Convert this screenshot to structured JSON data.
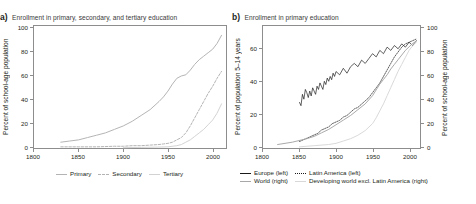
{
  "figure": {
    "panels": [
      {
        "letter": "a)",
        "title": "Enrollment in primary, secondary, and tertiary education",
        "y_left_title": "Percent of school-age population",
        "y_left_ticks": [
          "0",
          "20",
          "40",
          "60",
          "80",
          "100"
        ],
        "x_ticks": [
          "1800",
          "1850",
          "1900",
          "1950",
          "2000"
        ],
        "legend": [
          {
            "label": "Primary",
            "style": "solid-gray"
          },
          {
            "label": "Secondary",
            "style": "dash-gray"
          },
          {
            "label": "Tertiary",
            "style": "solid-light"
          }
        ]
      },
      {
        "letter": "b)",
        "title": "Enrollment in primary education",
        "y_left_title": "Percent of population 5–14 years",
        "y_left_ticks": [
          "0",
          "20",
          "40",
          "60"
        ],
        "y_right_title": "Percent of school-age population",
        "y_right_ticks": [
          "0",
          "20",
          "40",
          "60",
          "80",
          "100"
        ],
        "x_ticks": [
          "1800",
          "1850",
          "1900",
          "1950",
          "2000"
        ],
        "legend": [
          {
            "label": "Europe (left)",
            "style": "solid-black"
          },
          {
            "label": "Latin America (left)",
            "style": "dot-black"
          },
          {
            "label": "World (right)",
            "style": "solid-mgray"
          },
          {
            "label": "Developing world excl. Latin America (right)",
            "style": "solid-lgray"
          }
        ]
      }
    ]
  },
  "colors": {
    "primary": "#b3b3b3",
    "secondary": "#b3b3b3",
    "tertiary": "#d2d2d2",
    "europe": "#1a1a1a",
    "latin_america": "#1a1a1a",
    "world": "#a8a8a8",
    "developing_world": "#d8d8d8",
    "axis": "#8d8d8d",
    "text": "#231f20"
  },
  "chart_data": [
    {
      "type": "line",
      "panel": "a",
      "title": "Enrollment in primary, secondary, and tertiary education",
      "xlabel": "",
      "ylabel": "Percent of school-age population",
      "xlim": [
        1800,
        2015
      ],
      "ylim": [
        0,
        105
      ],
      "yticks": [
        0,
        20,
        40,
        60,
        80,
        100
      ],
      "xticks": [
        1800,
        1850,
        1900,
        1950,
        2000
      ],
      "grid": false,
      "legend_position": "below",
      "series": [
        {
          "name": "Primary",
          "style": "solid",
          "color": "#b3b3b3",
          "x": [
            1830,
            1840,
            1850,
            1860,
            1870,
            1880,
            1890,
            1900,
            1910,
            1920,
            1930,
            1940,
            1945,
            1950,
            1955,
            1960,
            1965,
            1970,
            1975,
            1980,
            1985,
            1990,
            1995,
            2000,
            2005,
            2010
          ],
          "y": [
            5,
            6,
            7,
            9,
            11,
            13,
            16,
            19,
            23,
            28,
            33,
            40,
            44,
            49,
            55,
            60,
            62,
            63,
            67,
            72,
            76,
            79,
            82,
            85,
            90,
            97
          ]
        },
        {
          "name": "Secondary",
          "style": "dashed",
          "color": "#b3b3b3",
          "x": [
            1830,
            1850,
            1870,
            1890,
            1900,
            1910,
            1920,
            1930,
            1940,
            1945,
            1950,
            1955,
            1960,
            1965,
            1970,
            1975,
            1980,
            1985,
            1990,
            1995,
            2000,
            2005,
            2010
          ],
          "y": [
            1,
            1,
            1,
            1.5,
            1.5,
            2,
            2,
            2.5,
            3,
            3.5,
            4,
            5,
            7,
            9,
            13,
            19,
            26,
            33,
            40,
            47,
            53,
            60,
            66
          ]
        },
        {
          "name": "Tertiary",
          "style": "solid",
          "color": "#d2d2d2",
          "x": [
            1900,
            1920,
            1940,
            1950,
            1960,
            1965,
            1970,
            1975,
            1980,
            1985,
            1990,
            1995,
            2000,
            2005,
            2010
          ],
          "y": [
            0.3,
            0.5,
            0.8,
            1,
            2,
            3,
            5,
            7,
            10,
            13,
            16,
            20,
            24,
            30,
            38
          ]
        }
      ]
    },
    {
      "type": "line",
      "panel": "b",
      "title": "Enrollment in primary education",
      "xlabel": "",
      "ylabel": "Percent of population 5–14 years",
      "ylabel_right": "Percent of school-age population",
      "xlim": [
        1800,
        2015
      ],
      "ylim": [
        0,
        75
      ],
      "ylim_right": [
        0,
        105
      ],
      "yticks": [
        0,
        20,
        40,
        60
      ],
      "yticks_right": [
        0,
        20,
        40,
        60,
        80,
        100
      ],
      "xticks": [
        1800,
        1850,
        1900,
        1950,
        2000
      ],
      "grid": false,
      "legend_position": "below",
      "series": [
        {
          "name": "Europe (left)",
          "axis": "left",
          "style": "solid",
          "color": "#1a1a1a",
          "x": [
            1850,
            1852,
            1854,
            1856,
            1858,
            1860,
            1862,
            1864,
            1866,
            1868,
            1870,
            1872,
            1874,
            1876,
            1878,
            1880,
            1882,
            1884,
            1886,
            1888,
            1890,
            1892,
            1894,
            1896,
            1898,
            1900,
            1905,
            1910,
            1915,
            1920,
            1925,
            1930,
            1935,
            1940,
            1945,
            1950,
            1955,
            1960,
            1965,
            1970,
            1975,
            1980,
            1985,
            1990,
            1995,
            2000,
            2005,
            2010
          ],
          "y": [
            28,
            26,
            33,
            30,
            36,
            34,
            31,
            35,
            32,
            37,
            35,
            33,
            38,
            36,
            40,
            38,
            36,
            41,
            39,
            43,
            41,
            44,
            42,
            46,
            44,
            47,
            45,
            49,
            46,
            50,
            52,
            50,
            54,
            52,
            55,
            58,
            56,
            60,
            58,
            62,
            60,
            63,
            61,
            64,
            62,
            65,
            63,
            66
          ]
        },
        {
          "name": "Latin America (left)",
          "axis": "left",
          "style": "dotted",
          "color": "#1a1a1a",
          "x": [
            1850,
            1855,
            1860,
            1865,
            1870,
            1875,
            1880,
            1885,
            1890,
            1895,
            1900,
            1905,
            1910,
            1915,
            1920,
            1925,
            1930,
            1935,
            1940,
            1945,
            1950,
            1955,
            1960,
            1965,
            1970,
            1975,
            1980,
            1985,
            1990,
            1995,
            2000,
            2005,
            2010
          ],
          "y": [
            4,
            5,
            6,
            7,
            8,
            9,
            11,
            12,
            13,
            15,
            16,
            17,
            19,
            20,
            22,
            24,
            25,
            27,
            29,
            31,
            34,
            37,
            40,
            44,
            48,
            52,
            56,
            59,
            62,
            64,
            65,
            66,
            67
          ]
        },
        {
          "name": "World (right)",
          "axis": "right",
          "style": "solid",
          "color": "#a8a8a8",
          "x": [
            1820,
            1840,
            1860,
            1870,
            1880,
            1890,
            1900,
            1910,
            1920,
            1930,
            1940,
            1950,
            1955,
            1960,
            1965,
            1970,
            1975,
            1980,
            1985,
            1990,
            1995,
            2000,
            2005,
            2010
          ],
          "y": [
            3,
            5,
            8,
            10,
            13,
            16,
            20,
            24,
            28,
            33,
            38,
            45,
            50,
            55,
            59,
            63,
            68,
            72,
            76,
            80,
            84,
            87,
            90,
            92
          ]
        },
        {
          "name": "Developing world excl. Latin America (right)",
          "axis": "right",
          "style": "solid",
          "color": "#d8d8d8",
          "x": [
            1850,
            1870,
            1890,
            1900,
            1910,
            1920,
            1930,
            1940,
            1950,
            1955,
            1960,
            1965,
            1970,
            1975,
            1980,
            1985,
            1990,
            1995,
            2000,
            2005,
            2010
          ],
          "y": [
            1,
            2,
            3,
            4,
            6,
            8,
            11,
            15,
            21,
            26,
            32,
            38,
            45,
            52,
            59,
            66,
            72,
            78,
            84,
            88,
            91
          ]
        }
      ]
    }
  ]
}
